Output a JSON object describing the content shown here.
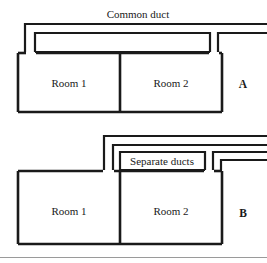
{
  "figure": {
    "background_color": "#ffffff",
    "line_color": "#1a1a1a",
    "panels": [
      {
        "id": "A",
        "letter": "A",
        "caption": "Common duct",
        "rooms": [
          {
            "label": "Room 1"
          },
          {
            "label": "Room 2"
          }
        ],
        "duct_type": "common",
        "duct_line_count": 2
      },
      {
        "id": "B",
        "letter": "B",
        "caption": "Separate ducts",
        "rooms": [
          {
            "label": "Room 1"
          },
          {
            "label": "Room 2"
          }
        ],
        "duct_type": "separate",
        "duct_line_count": 4
      }
    ]
  },
  "panel_a": {
    "caption": "Common duct",
    "room1_label": "Room 1",
    "room2_label": "Room 2",
    "letter": "A"
  },
  "panel_b": {
    "caption": "Separate ducts",
    "room1_label": "Room 1",
    "room2_label": "Room 2",
    "letter": "B"
  }
}
